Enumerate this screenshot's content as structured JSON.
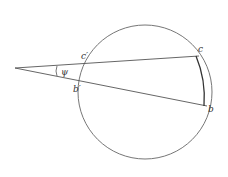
{
  "diagram": {
    "labels": {
      "c_prime": "c′",
      "c": "c",
      "b_prime": "b′",
      "b": "b",
      "angle": "ψ"
    },
    "colors": {
      "stroke": "#555555",
      "background": "#ffffff"
    }
  }
}
